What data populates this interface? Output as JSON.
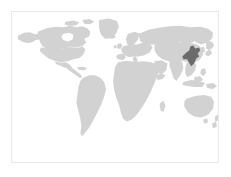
{
  "map": {
    "type": "world-locator-map",
    "title": "World locator map",
    "projection": "equirectangular",
    "frame": {
      "border_color": "#e9e9e9",
      "background_color": "#ffffff",
      "x": 11,
      "y": 11,
      "width": 208,
      "height": 152
    },
    "colors": {
      "ocean": "#ffffff",
      "land": "#d2d2d2",
      "highlight": "#6b6b6b",
      "page_background": "#ffffff",
      "border": "#e9e9e9"
    },
    "legend_visible": false,
    "labels_visible": false,
    "graticule_visible": false,
    "landmasses": [
      {
        "name": "North America",
        "color_key": "land"
      },
      {
        "name": "Greenland",
        "color_key": "land"
      },
      {
        "name": "South America",
        "color_key": "land"
      },
      {
        "name": "Europe",
        "color_key": "land"
      },
      {
        "name": "Africa",
        "color_key": "land"
      },
      {
        "name": "Asia",
        "color_key": "land"
      },
      {
        "name": "Australia",
        "color_key": "land"
      },
      {
        "name": "New Zealand",
        "color_key": "land"
      },
      {
        "name": "Japan",
        "color_key": "land"
      },
      {
        "name": "Indonesia",
        "color_key": "land"
      },
      {
        "name": "Madagascar",
        "color_key": "land"
      },
      {
        "name": "British Isles",
        "color_key": "land"
      }
    ],
    "highlight": {
      "region_label": "Northeastern China",
      "continent": "Asia",
      "color": "#6b6b6b",
      "center_x": 177,
      "center_y": 65
    }
  }
}
